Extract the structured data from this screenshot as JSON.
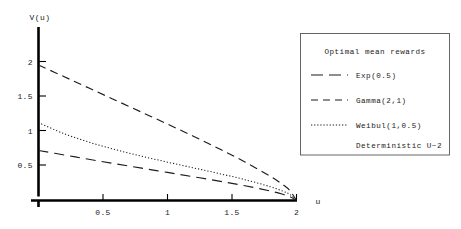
{
  "chart_data": {
    "type": "line",
    "title": "",
    "xlabel": "u",
    "ylabel": "V(u)",
    "xlim": [
      0,
      2.1
    ],
    "ylim": [
      0,
      2.15
    ],
    "grid": false,
    "x_ticks": [
      "0.5",
      "1",
      "1.5",
      "2"
    ],
    "x_tick_values": [
      0.5,
      1,
      1.5,
      2
    ],
    "y_ticks": [
      "0.5",
      "1",
      "1.5",
      "2"
    ],
    "y_tick_values": [
      0.5,
      1,
      1.5,
      2
    ],
    "legend_position": "right",
    "legend_title": "Optimal mean rewards",
    "legend_note": "Deterministic U~2",
    "series": [
      {
        "name": "Exp(0.5)",
        "style": "long-dash",
        "x": [
          0,
          0.2,
          0.4,
          0.6,
          0.8,
          1.0,
          1.2,
          1.4,
          1.6,
          1.8,
          1.9,
          1.95,
          2.0
        ],
        "values": [
          0.72,
          0.655,
          0.59,
          0.527,
          0.465,
          0.404,
          0.342,
          0.279,
          0.212,
          0.135,
          0.086,
          0.055,
          0.0
        ]
      },
      {
        "name": "Gamma(2,1)",
        "style": "dash",
        "x": [
          0,
          0.2,
          0.4,
          0.6,
          0.8,
          1.0,
          1.2,
          1.4,
          1.6,
          1.8,
          1.9,
          1.95,
          2.0
        ],
        "values": [
          1.95,
          1.78,
          1.61,
          1.44,
          1.27,
          1.1,
          0.925,
          0.745,
          0.555,
          0.345,
          0.22,
          0.14,
          0.0
        ]
      },
      {
        "name": "Weibul(1,0.5)",
        "style": "dotted",
        "x": [
          0,
          0.2,
          0.4,
          0.6,
          0.8,
          1.0,
          1.2,
          1.4,
          1.6,
          1.8,
          1.9,
          1.95,
          2.0
        ],
        "values": [
          1.12,
          0.96,
          0.835,
          0.73,
          0.637,
          0.552,
          0.47,
          0.388,
          0.3,
          0.197,
          0.13,
          0.085,
          0.0
        ]
      }
    ]
  },
  "axes": {
    "y_axis_label": "V(u)",
    "x_axis_label": "u"
  },
  "legend": {
    "title": "Optimal mean rewards",
    "entries": [
      {
        "label": "Exp(0.5)",
        "sample": "long-dash"
      },
      {
        "label": "Gamma(2,1)",
        "sample": "dash"
      },
      {
        "label": "Weibul(1,0.5)",
        "sample": "dotted"
      }
    ],
    "note": "Deterministic U~2"
  }
}
